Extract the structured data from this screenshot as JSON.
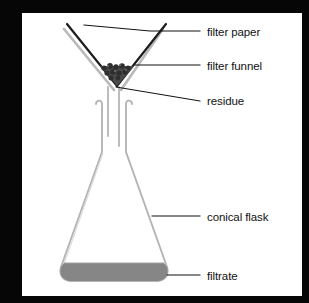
{
  "diagram": {
    "background_color": "#ffffff",
    "frame_color": "#060606",
    "canvas": {
      "x": 22,
      "y": 13,
      "width": 280,
      "height": 283
    },
    "line_color": "#111111",
    "glass_color": "#b4b4b4",
    "glass_shadow_color": "#d8d8d8",
    "filtrate_color": "#868686",
    "residue_color": "#4a4a4a",
    "labels": [
      {
        "id": "filter-paper",
        "text": "filter paper",
        "x": 185,
        "y": 13,
        "leader": {
          "from_x": 62,
          "from_y": 12,
          "bend_x": 128,
          "bend_y": 18,
          "to_x": 178,
          "to_y": 18
        }
      },
      {
        "id": "filter-funnel",
        "text": "filter funnel",
        "x": 185,
        "y": 47,
        "leader": {
          "from_x": 113,
          "from_y": 52,
          "bend_x": 135,
          "bend_y": 52,
          "to_x": 178,
          "to_y": 52
        }
      },
      {
        "id": "residue",
        "text": "residue",
        "x": 185,
        "y": 82,
        "leader": {
          "from_x": 94,
          "from_y": 74,
          "bend_x": 140,
          "bend_y": 84,
          "to_x": 178,
          "to_y": 88
        }
      },
      {
        "id": "conical-flask",
        "text": "conical flask",
        "x": 185,
        "y": 198,
        "leader": {
          "from_x": 130,
          "from_y": 203,
          "bend_x": 150,
          "bend_y": 203,
          "to_x": 178,
          "to_y": 203
        }
      },
      {
        "id": "filtrate",
        "text": "filtrate",
        "x": 185,
        "y": 257,
        "leader": {
          "from_x": 145,
          "from_y": 262,
          "bend_x": 160,
          "bend_y": 262,
          "to_x": 178,
          "to_y": 262
        }
      }
    ],
    "parts": [
      {
        "id": "filter-paper",
        "name": "filter paper",
        "description": "dark V-shaped cone lining the inside of the funnel"
      },
      {
        "id": "filter-funnel",
        "name": "filter funnel",
        "description": "grey glass cone with vertical stem entering the flask neck"
      },
      {
        "id": "residue",
        "name": "residue",
        "description": "dark granular solid collected at the bottom of the filter paper cone"
      },
      {
        "id": "conical-flask",
        "name": "conical flask",
        "description": "Erlenmeyer flask receiving the filtrate"
      },
      {
        "id": "filtrate",
        "name": "filtrate",
        "description": "grey liquid pooled in the bottom of the conical flask"
      }
    ]
  }
}
